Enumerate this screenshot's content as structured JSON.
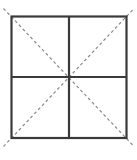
{
  "figure": {
    "background_color": "#ffffff",
    "canvas": {
      "width": 137,
      "height": 160
    }
  },
  "style": {
    "solid_line_color": "#3a3a3a",
    "solid_line_width": 2.2,
    "dashed_line_color": "#8a8a8a",
    "dashed_line_width": 1.2,
    "dash_pattern": "3 2.6"
  },
  "geometry": {
    "square": {
      "label": "outer-square",
      "left": 11.5,
      "top": 16.5,
      "right": 126.5,
      "bottom": 138.0,
      "width": 115.0,
      "height": 121.5
    },
    "center": {
      "x": 69.0,
      "y": 77.0
    },
    "midlines": {
      "vertical": {
        "label": "vertical-midline",
        "x": 69.0,
        "y1": 16.5,
        "y2": 138.0
      },
      "horizontal": {
        "label": "horizontal-midline",
        "y": 77.0,
        "x1": 11.5,
        "x2": 126.5
      }
    },
    "diagonals": [
      {
        "label": "diagonal-tl-br",
        "x1": 3.5,
        "y1": 8.5,
        "x2": 134.0,
        "y2": 146.5
      },
      {
        "label": "diagonal-bl-tr",
        "x1": 3.5,
        "y1": 146.5,
        "x2": 134.0,
        "y2": 8.5
      }
    ],
    "quadrants": [
      {
        "label": "quadrant-top-left",
        "x": 11.5,
        "y": 16.5,
        "width": 57.5,
        "height": 60.5
      },
      {
        "label": "quadrant-top-right",
        "x": 69.0,
        "y": 16.5,
        "width": 57.5,
        "height": 60.5
      },
      {
        "label": "quadrant-bottom-left",
        "x": 11.5,
        "y": 77.0,
        "width": 57.5,
        "height": 61.0
      },
      {
        "label": "quadrant-bottom-right",
        "x": 69.0,
        "y": 77.0,
        "width": 57.5,
        "height": 61.0
      }
    ]
  },
  "labels": {
    "text_items": []
  }
}
